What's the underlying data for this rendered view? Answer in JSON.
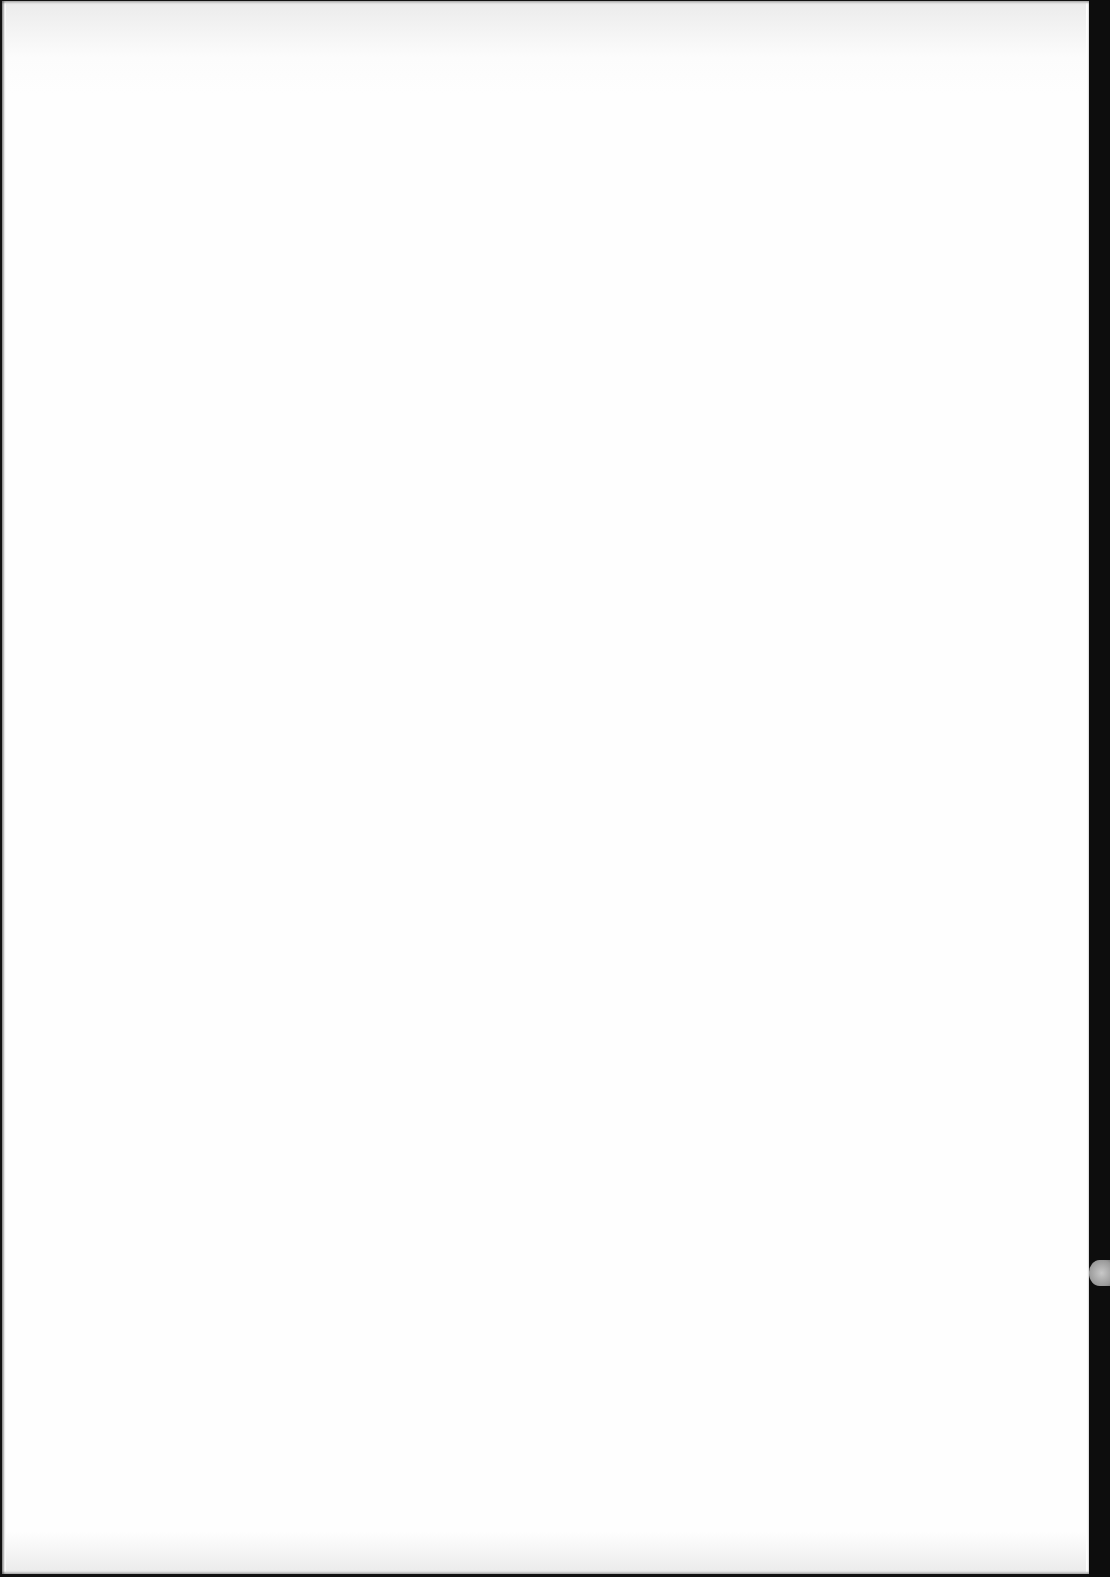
{
  "document": {
    "type": "scanned-page",
    "content": "",
    "colors": {
      "page": "#fefefe",
      "scanner_background": "#111111",
      "hole_artifact": "#a0a0a0"
    }
  }
}
